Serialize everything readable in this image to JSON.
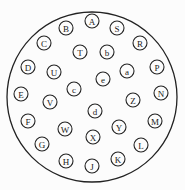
{
  "diagram": {
    "title": "",
    "type": "circular-connector-pinout",
    "outer": {
      "cx": 92,
      "cy": 97,
      "r": 85
    },
    "pin_radius": 7,
    "pins": [
      {
        "label": "A",
        "x": 92,
        "y": 21
      },
      {
        "label": "B",
        "x": 66,
        "y": 28
      },
      {
        "label": "S",
        "x": 117,
        "y": 28
      },
      {
        "label": "C",
        "x": 44,
        "y": 43
      },
      {
        "label": "R",
        "x": 140,
        "y": 43
      },
      {
        "label": "T",
        "x": 80,
        "y": 52
      },
      {
        "label": "b",
        "x": 107,
        "y": 52
      },
      {
        "label": "D",
        "x": 28,
        "y": 67
      },
      {
        "label": "U",
        "x": 54,
        "y": 72
      },
      {
        "label": "a",
        "x": 127,
        "y": 71
      },
      {
        "label": "P",
        "x": 157,
        "y": 67
      },
      {
        "label": "e",
        "x": 103,
        "y": 79
      },
      {
        "label": "c",
        "x": 74,
        "y": 89
      },
      {
        "label": "E",
        "x": 21,
        "y": 94
      },
      {
        "label": "V",
        "x": 50,
        "y": 102
      },
      {
        "label": "N",
        "x": 161,
        "y": 93
      },
      {
        "label": "Z",
        "x": 133,
        "y": 100
      },
      {
        "label": "d",
        "x": 95,
        "y": 111
      },
      {
        "label": "F",
        "x": 28,
        "y": 121
      },
      {
        "label": "W",
        "x": 65,
        "y": 129
      },
      {
        "label": "Y",
        "x": 119,
        "y": 127
      },
      {
        "label": "M",
        "x": 155,
        "y": 121
      },
      {
        "label": "X",
        "x": 93,
        "y": 137
      },
      {
        "label": "G",
        "x": 42,
        "y": 144
      },
      {
        "label": "L",
        "x": 141,
        "y": 145
      },
      {
        "label": "H",
        "x": 66,
        "y": 161
      },
      {
        "label": "K",
        "x": 118,
        "y": 159
      },
      {
        "label": "J",
        "x": 92,
        "y": 166
      }
    ]
  }
}
